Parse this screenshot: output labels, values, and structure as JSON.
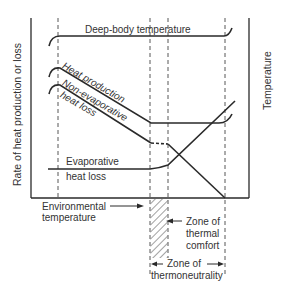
{
  "diagram": {
    "type": "thermoregulation-zones",
    "y_axis_label": "Rate of heat production or loss",
    "right_axis_label": "Temperature",
    "x_axis_label": "Environmental temperature",
    "x_axis_arrow": "→",
    "curves": {
      "deep_body": "Deep-body temperature",
      "heat_production": "Heat production",
      "non_evaporative_line1": "Non-evaporative",
      "non_evaporative_line2": "heat loss",
      "evaporative_line1": "Evaporative",
      "evaporative_line2": "heat loss"
    },
    "zones": {
      "thermal_comfort_line1": "Zone of",
      "thermal_comfort_line2": "thermal",
      "thermal_comfort_line3": "comfort",
      "thermoneutrality_line1": "Zone of",
      "thermoneutrality_line2": "thermoneutrality"
    },
    "colors": {
      "line": "#2a2a2a",
      "text": "#333333",
      "background": "#ffffff"
    }
  }
}
